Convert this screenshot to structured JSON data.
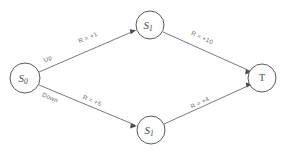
{
  "diagram": {
    "type": "state-transition-graph",
    "background_color": "#ffffff",
    "stroke_color": "#6b6b6b",
    "text_color": "#4a4a4a",
    "nodes": [
      {
        "id": "s0",
        "label": "S",
        "subscript": "0",
        "cx": 25,
        "cy": 78,
        "r": 15
      },
      {
        "id": "s1_top",
        "label": "S",
        "subscript": "1",
        "cx": 150,
        "cy": 25,
        "r": 14
      },
      {
        "id": "s1_bot",
        "label": "S",
        "subscript": "1",
        "cx": 151,
        "cy": 130,
        "r": 14
      },
      {
        "id": "t",
        "label": "T",
        "subscript": "",
        "cx": 262,
        "cy": 78,
        "r": 14
      }
    ],
    "action_labels": [
      {
        "id": "action-up",
        "text": "Up",
        "x": 48,
        "y": 59,
        "rotate": -23
      },
      {
        "id": "action-down",
        "text": "Down",
        "x": 50,
        "y": 98,
        "rotate": 23
      }
    ],
    "edges": [
      {
        "id": "edge-s0-s1top",
        "from": "s0",
        "to": "s1_top",
        "label": "R = +1",
        "label_x": 88,
        "label_y": 38,
        "label_rotate": -23
      },
      {
        "id": "edge-s1top-t",
        "from": "s1_top",
        "to": "t",
        "label": "R = +10",
        "label_x": 202,
        "label_y": 38,
        "label_rotate": 25
      },
      {
        "id": "edge-s0-s1bot",
        "from": "s0",
        "to": "s1_bot",
        "label": "R = +5",
        "label_x": 92,
        "label_y": 101,
        "label_rotate": 23
      },
      {
        "id": "edge-s1bot-t",
        "from": "s1_bot",
        "to": "t",
        "label": "R = +4",
        "label_x": 200,
        "label_y": 103,
        "label_rotate": -25
      }
    ]
  }
}
